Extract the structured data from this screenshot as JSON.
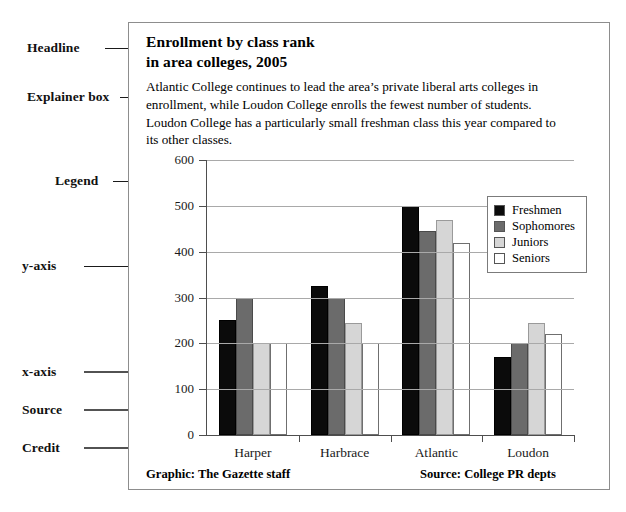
{
  "annotations": [
    {
      "label": "Headline",
      "name": "annotation-headline"
    },
    {
      "label": "Explainer box",
      "name": "annotation-explainer-box"
    },
    {
      "label": "Legend",
      "name": "annotation-legend"
    },
    {
      "label": "y-axis",
      "name": "annotation-y-axis"
    },
    {
      "label": "x-axis",
      "name": "annotation-x-axis"
    },
    {
      "label": "Source",
      "name": "annotation-source"
    },
    {
      "label": "Credit",
      "name": "annotation-credit"
    }
  ],
  "graphic": {
    "headline_line1": "Enrollment by class rank",
    "headline_line2": "in area colleges, 2005",
    "explainer": "Atlantic College continues to lead the area’s private liberal arts colleges in enrollment, while Loudon College enrolls the fewest number of students. Loudon College has a particularly small freshman class this year compared to its other classes.",
    "credit": "Graphic: The Gazette staff",
    "source": "Source: College PR depts"
  },
  "colors": {
    "freshmen": "#0b0b0b",
    "sophomores": "#6b6b6b",
    "juniors": "#d6d6d6",
    "seniors": "#ffffff",
    "frame": "#8d8d8d",
    "axis": "#4e4e4e",
    "grid": "#a9a9a9"
  },
  "chart_data": {
    "type": "bar",
    "title": "Enrollment by class rank in area colleges, 2005",
    "xlabel": "",
    "ylabel": "",
    "categories": [
      "Harper",
      "Harbrace",
      "Atlantic",
      "Loudon"
    ],
    "series": [
      {
        "name": "Freshmen",
        "values": [
          250,
          325,
          500,
          170
        ]
      },
      {
        "name": "Sophomores",
        "values": [
          300,
          300,
          445,
          200
        ]
      },
      {
        "name": "Juniors",
        "values": [
          200,
          245,
          470,
          245
        ]
      },
      {
        "name": "Seniors",
        "values": [
          200,
          200,
          420,
          220
        ]
      }
    ],
    "ylim": [
      0,
      600
    ],
    "yticks": [
      0,
      100,
      200,
      300,
      400,
      500,
      600
    ],
    "ytick_labels": [
      "0",
      "100",
      "200",
      "300",
      "400",
      "500",
      "600"
    ],
    "grid": true,
    "legend_position": "right"
  }
}
